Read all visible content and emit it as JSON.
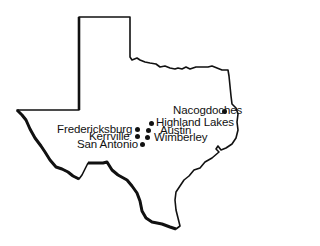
{
  "map": {
    "region": "Texas",
    "cities": [
      {
        "name": "Nacogdoches",
        "dot": [
          225,
          112
        ],
        "label_pos": [
          175,
          105
        ],
        "label_side": "left"
      },
      {
        "name": "Highland Lakes",
        "dot": [
          152,
          124
        ],
        "label_pos": [
          158,
          117
        ],
        "label_side": "right"
      },
      {
        "name": "Austin",
        "dot": [
          149,
          131
        ],
        "label_pos": [
          157,
          125
        ],
        "label_side": "right"
      },
      {
        "name": "Wimberley",
        "dot": [
          148,
          138
        ],
        "label_pos": [
          155,
          132
        ],
        "label_side": "right"
      },
      {
        "name": "Fredericksburg",
        "dot": [
          138,
          130
        ],
        "label_pos": [
          60,
          124
        ],
        "label_side": "left"
      },
      {
        "name": "Kerrville",
        "dot": [
          138,
          137
        ],
        "label_pos": [
          89,
          131
        ],
        "label_side": "left"
      },
      {
        "name": "San Antonio",
        "dot": [
          143,
          145
        ],
        "label_pos": [
          78,
          139
        ],
        "label_side": "left"
      }
    ],
    "outline_color": "#111111",
    "dot_color": "#111111"
  }
}
